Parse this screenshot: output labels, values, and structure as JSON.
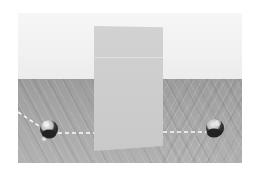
{
  "scene": {
    "description": "3D rendered scene: an upright rectangular panel standing on a wooden floor in front of a light wall, with two spheres and dashed trajectory lines passing behind the panel",
    "colors": {
      "background": "#ffffff",
      "wall": "#f2f2f2",
      "floor": "#a6a6a6",
      "panel": "#cdcdcd",
      "sphere_dark": "#2a2a2a",
      "sphere_light": "#e0e0e0",
      "dash_line": "#ffffff"
    },
    "objects": {
      "panel": "upright-rectangular-panel",
      "left_sphere": "sphere",
      "right_sphere": "sphere",
      "trajectory": "dashed-path"
    }
  }
}
